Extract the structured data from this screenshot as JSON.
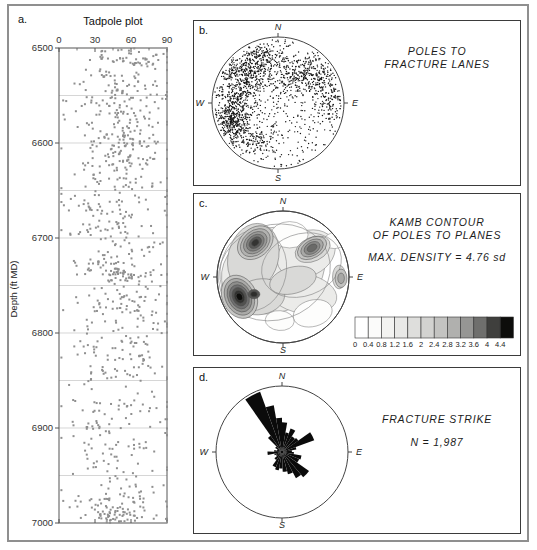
{
  "labels": {
    "a": "a.",
    "b": "b.",
    "c": "c.",
    "d": "d."
  },
  "compass": {
    "n": "N",
    "e": "E",
    "s": "S",
    "w": "W"
  },
  "panel_a": {
    "title": "Tadpole plot",
    "ylabel": "Depth (ft MD)"
  },
  "panel_b": {
    "caption_line1": "POLES TO",
    "caption_line2": "FRACTURE LANES"
  },
  "panel_c": {
    "caption_line1": "KAMB CONTOUR",
    "caption_line2": "OF POLES TO PLANES",
    "max_density": "MAX. DENSITY = 4.76 sd"
  },
  "panel_d": {
    "caption_line1": "FRACTURE STRIKE",
    "caption_line2": "N = 1,987"
  },
  "colors": {
    "figure_border": "#8f8f8f",
    "panel_border": "#3b3b3b",
    "tadpole_dot": "#8f8f8f",
    "stereonet_dot": "#161616",
    "rose_fill": "#0b0b0b"
  },
  "chart_data": [
    {
      "id": "tadpole",
      "type": "scatter",
      "title": "Tadpole plot",
      "ylabel": "Depth (ft MD)",
      "xlim": [
        0,
        90
      ],
      "ylim": [
        6500,
        7000
      ],
      "xticks": [
        0,
        30,
        60,
        90
      ],
      "xticks_minor": [
        15,
        45,
        75
      ],
      "yticks": [
        6500,
        6600,
        6700,
        6800,
        6900,
        7000
      ],
      "grid_step": 50,
      "grid": true,
      "point_color": "#8f8f8f",
      "seed": 7,
      "band_format": [
        "depth_min_ft",
        "depth_max_ft",
        "dip_mean_deg",
        "dip_sd_deg",
        "n_points"
      ],
      "bands": [
        [
          6500,
          6520,
          60,
          16,
          55
        ],
        [
          6520,
          6555,
          55,
          20,
          70
        ],
        [
          6555,
          6575,
          50,
          22,
          45
        ],
        [
          6575,
          6625,
          55,
          20,
          130
        ],
        [
          6625,
          6665,
          48,
          24,
          65
        ],
        [
          6665,
          6705,
          45,
          24,
          70
        ],
        [
          6705,
          6760,
          52,
          20,
          85
        ],
        [
          6725,
          6745,
          48,
          9,
          35
        ],
        [
          6760,
          6800,
          55,
          22,
          75
        ],
        [
          6800,
          6845,
          52,
          22,
          70
        ],
        [
          6845,
          6885,
          48,
          25,
          45
        ],
        [
          6885,
          6920,
          55,
          22,
          45
        ],
        [
          6920,
          6960,
          50,
          24,
          40
        ],
        [
          6960,
          7000,
          52,
          22,
          80
        ],
        [
          6985,
          7000,
          48,
          10,
          30
        ]
      ]
    },
    {
      "id": "stereonet-poles",
      "type": "scatter",
      "subtype": "equal-area-stereonet",
      "title": "POLES TO FRACTURE LANES",
      "n_points": 1987,
      "dot_color": "#161616",
      "seed": 11,
      "cluster_format": "unit-disk coords, x east, y north",
      "clusters": [
        {
          "kind": "uniform",
          "count": 500
        },
        {
          "kind": "gauss",
          "x": -0.42,
          "y": 0.5,
          "sx": 0.2,
          "sy": 0.18,
          "count": 330
        },
        {
          "kind": "gauss",
          "x": -0.62,
          "y": 0.1,
          "sx": 0.16,
          "sy": 0.22,
          "count": 220
        },
        {
          "kind": "gauss",
          "x": -0.7,
          "y": -0.28,
          "sx": 0.14,
          "sy": 0.16,
          "count": 330
        },
        {
          "kind": "gauss",
          "x": 0.42,
          "y": 0.42,
          "sx": 0.22,
          "sy": 0.16,
          "count": 280
        },
        {
          "kind": "gauss",
          "x": 0.8,
          "y": 0.05,
          "sx": 0.12,
          "sy": 0.2,
          "count": 120
        },
        {
          "kind": "gauss",
          "x": -0.15,
          "y": 0.72,
          "sx": 0.18,
          "sy": 0.12,
          "count": 110
        },
        {
          "kind": "gauss",
          "x": -0.35,
          "y": -0.55,
          "sx": 0.15,
          "sy": 0.12,
          "count": 100
        }
      ]
    },
    {
      "id": "kamb-contour",
      "type": "heatmap",
      "subtype": "kamb-contour-stereonet",
      "title": "KAMB CONTOUR OF POLES TO PLANES",
      "max_density_sd": 4.76,
      "levels": [
        0,
        0.4,
        0.8,
        1.2,
        1.6,
        2,
        2.4,
        2.8,
        3.2,
        3.6,
        4,
        4.4
      ],
      "colorbar_colors": [
        "#ffffff",
        "#fbfbfa",
        "#f3f3f1",
        "#e9e9e7",
        "#dededc",
        "#d2d2d0",
        "#c3c3c1",
        "#b0b0ae",
        "#969694",
        "#6f6f6d",
        "#3f3f3d",
        "#0d0d0b"
      ],
      "field_blobs": [
        {
          "x": -0.15,
          "y": 0.1,
          "rx": 0.8,
          "ry": 0.64,
          "rot": -20,
          "fill": "#ebebe9"
        },
        {
          "x": 0.35,
          "y": 0.35,
          "rx": 0.46,
          "ry": 0.34,
          "rot": -25,
          "fill": "#ebebe9"
        },
        {
          "x": 0.3,
          "y": -0.25,
          "rx": 0.52,
          "ry": 0.3,
          "rot": 10,
          "fill": "#ebebe9"
        }
      ],
      "white_patches": [
        {
          "x": 0.1,
          "y": 0.64,
          "rx": 0.28,
          "ry": 0.2,
          "rot": 0,
          "fill": "#fdfdfc"
        },
        {
          "x": 0.45,
          "y": -0.55,
          "rx": 0.3,
          "ry": 0.2,
          "rot": -15,
          "fill": "#fdfdfc"
        },
        {
          "x": -0.05,
          "y": -0.66,
          "rx": 0.22,
          "ry": 0.15,
          "rot": 5,
          "fill": "#fdfdfc"
        },
        {
          "x": 0.78,
          "y": 0.55,
          "rx": 0.16,
          "ry": 0.12,
          "rot": 0,
          "fill": "#fdfdfc"
        }
      ],
      "medium_blobs": [
        {
          "x": -0.45,
          "y": 0.3,
          "rx": 0.38,
          "ry": 0.52,
          "rot": 15,
          "fill": "#d9d9d7"
        },
        {
          "x": -0.35,
          "y": -0.3,
          "rx": 0.38,
          "ry": 0.27,
          "rot": -10,
          "fill": "#d9d9d7"
        },
        {
          "x": 0.45,
          "y": 0.42,
          "rx": 0.28,
          "ry": 0.18,
          "rot": -25,
          "fill": "#d9d9d7"
        },
        {
          "x": 0.15,
          "y": -0.05,
          "rx": 0.36,
          "ry": 0.2,
          "rot": -15,
          "fill": "#d9d9d7"
        },
        {
          "x": 0.85,
          "y": 0.0,
          "rx": 0.1,
          "ry": 0.18,
          "rot": 0,
          "fill": "#d9d9d7"
        }
      ],
      "contour_outlines": [
        {
          "x": -0.13,
          "y": 0.07,
          "rx": 0.86,
          "ry": 0.72,
          "rot": -18
        },
        {
          "x": 0.28,
          "y": 0.18,
          "rx": 0.62,
          "ry": 0.47,
          "rot": -20
        },
        {
          "x": -0.45,
          "y": 0.1,
          "rx": 0.5,
          "ry": 0.62,
          "rot": 12
        }
      ],
      "ring_format": [
        "rx",
        "ry",
        "fill"
      ],
      "maxima": [
        {
          "x": -0.42,
          "y": 0.52,
          "rot": -40,
          "rings": [
            [
              0.3,
              0.22,
              "#c6c6c4"
            ],
            [
              0.25,
              0.18,
              "#b2b2b0"
            ],
            [
              0.2,
              0.145,
              "#9a9a98"
            ],
            [
              0.15,
              0.11,
              "#7e7e7c"
            ],
            [
              0.105,
              0.075,
              "#5a5a58"
            ],
            [
              0.06,
              0.045,
              "#343432"
            ]
          ]
        },
        {
          "x": -0.66,
          "y": -0.3,
          "rot": 65,
          "rings": [
            [
              0.34,
              0.26,
              "#c6c6c4"
            ],
            [
              0.29,
              0.215,
              "#aaaaa8"
            ],
            [
              0.24,
              0.175,
              "#8e8e8c"
            ],
            [
              0.19,
              0.14,
              "#707070"
            ],
            [
              0.145,
              0.105,
              "#525250"
            ],
            [
              0.1,
              0.075,
              "#323230"
            ],
            [
              0.06,
              0.045,
              "#0e0e0c"
            ]
          ]
        },
        {
          "x": -0.44,
          "y": -0.26,
          "rot": 0,
          "rings": [
            [
              0.09,
              0.07,
              "#565654"
            ],
            [
              0.05,
              0.04,
              "#2e2e2c"
            ]
          ]
        },
        {
          "x": 0.44,
          "y": 0.44,
          "rot": -30,
          "rings": [
            [
              0.24,
              0.15,
              "#c2c2c0"
            ],
            [
              0.185,
              0.115,
              "#a8a8a6"
            ],
            [
              0.13,
              0.085,
              "#8a8a88"
            ],
            [
              0.08,
              0.05,
              "#6a6a68"
            ]
          ]
        },
        {
          "x": 0.88,
          "y": -0.02,
          "rot": 0,
          "rings": [
            [
              0.09,
              0.14,
              "#c2c2c0"
            ],
            [
              0.05,
              0.08,
              "#a8a8a6"
            ]
          ]
        }
      ]
    },
    {
      "id": "rose",
      "type": "rose",
      "title": "FRACTURE STRIKE",
      "n": 1987,
      "color": "#0b0b0b",
      "petal_format": [
        "azimuth_start_deg",
        "azimuth_end_deg",
        "length_fraction_of_radius"
      ],
      "petals": [
        [
          315,
          325,
          0.3
        ],
        [
          325,
          340,
          0.97
        ],
        [
          340,
          350,
          0.72
        ],
        [
          350,
          360,
          0.52
        ],
        [
          0,
          10,
          0.45
        ],
        [
          10,
          20,
          0.3
        ],
        [
          20,
          32,
          0.38
        ],
        [
          32,
          45,
          0.28
        ],
        [
          45,
          55,
          0.3
        ],
        [
          55,
          70,
          0.52
        ],
        [
          70,
          80,
          0.22
        ],
        [
          80,
          90,
          0.15
        ],
        [
          90,
          100,
          0.18
        ],
        [
          100,
          112,
          0.3
        ],
        [
          112,
          125,
          0.28
        ],
        [
          125,
          140,
          0.5
        ],
        [
          140,
          152,
          0.45
        ],
        [
          152,
          165,
          0.35
        ],
        [
          165,
          178,
          0.3
        ],
        [
          178,
          190,
          0.25
        ],
        [
          190,
          202,
          0.28
        ],
        [
          202,
          215,
          0.25
        ],
        [
          215,
          230,
          0.15
        ],
        [
          230,
          245,
          0.1
        ],
        [
          245,
          258,
          0.12
        ],
        [
          258,
          272,
          0.22
        ],
        [
          272,
          285,
          0.12
        ],
        [
          285,
          300,
          0.08
        ],
        [
          300,
          315,
          0.12
        ]
      ]
    }
  ]
}
